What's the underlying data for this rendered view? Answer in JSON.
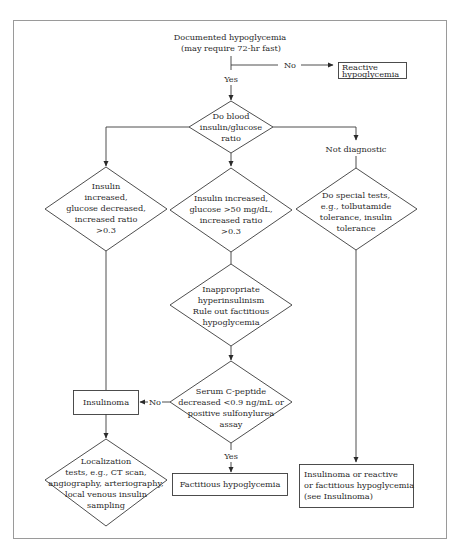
{
  "diagram": {
    "title_lines": [
      "Documented hypoglycemia",
      "(may require 72-hr fast)"
    ],
    "branch_labels": {
      "no_top": "No",
      "yes_top": "Yes",
      "no_serum": "No",
      "yes_serum": "Yes",
      "not_diagnostic": "Not diagnostic"
    },
    "nodes": {
      "reactive": [
        "Reactive",
        "hypoglycemia"
      ],
      "ratio": [
        "Do blood",
        "insulin/glucose",
        "ratio"
      ],
      "left": [
        "Insulin",
        "increased,",
        "glucose decreased,",
        "increased ratio",
        ">0.3"
      ],
      "center": [
        "Insulin increased,",
        "glucose >50 mg/dL,",
        "increased ratio",
        ">0.3"
      ],
      "right": [
        "Do special tests,",
        "e.g., tolbutamide",
        "tolerance, insulin",
        "tolerance"
      ],
      "inappropriate": [
        "Inappropriate",
        "hyperinsulinism",
        "Rule out factitious",
        "hypoglycemia"
      ],
      "serum": [
        "Serum C-peptide",
        "decreased <0.9 ng/mL or",
        "positive sulfonylurea",
        "assay"
      ],
      "insulinoma": [
        "Insulinoma"
      ],
      "localization": [
        "Localization",
        "tests, e.g., CT scan,",
        "angiography, arteriography,",
        "local venous insulin",
        "sampling"
      ],
      "factitious": [
        "Factitious hypoglycemia"
      ],
      "final": [
        "Insulinoma or reactive",
        "or factitious hypoglycemia",
        "(see Insulinoma)"
      ]
    },
    "colors": {
      "line": "#3a3a3a",
      "text": "#2a2a2a",
      "frame": "#9a9a9a",
      "background": "#ffffff"
    }
  }
}
